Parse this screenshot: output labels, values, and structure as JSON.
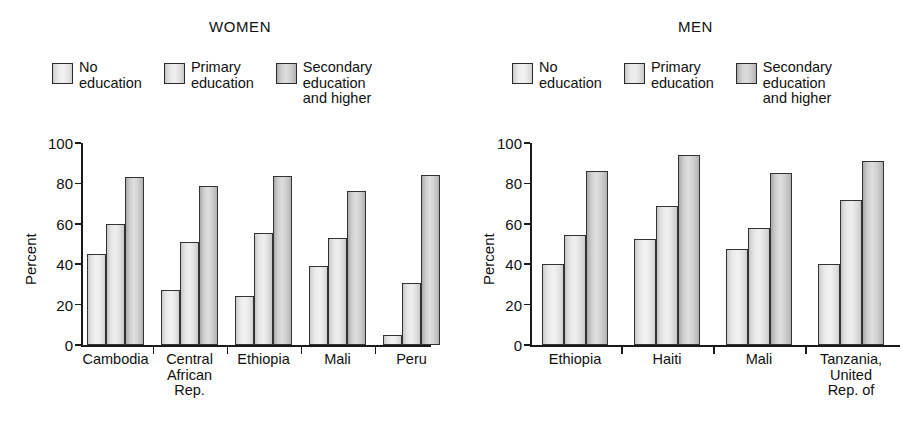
{
  "chart_data": [
    {
      "type": "bar",
      "title": "WOMEN",
      "xlabel": "",
      "ylabel": "Percent",
      "ylim": [
        0,
        100
      ],
      "yticks": [
        0,
        20,
        40,
        60,
        80,
        100
      ],
      "grid": false,
      "legend_position": "top",
      "categories": [
        "Cambodia",
        "Central\nAfrican\nRep.",
        "Ethiopia",
        "Mali",
        "Peru"
      ],
      "series": [
        {
          "name": "No education",
          "values": [
            45,
            27,
            24.5,
            39,
            5
          ]
        },
        {
          "name": "Primary education",
          "values": [
            60,
            51,
            55.5,
            53,
            30.5
          ]
        },
        {
          "name": "Secondary education and higher",
          "values": [
            83,
            78.5,
            83.5,
            76,
            84
          ]
        }
      ]
    },
    {
      "type": "bar",
      "title": "MEN",
      "xlabel": "",
      "ylabel": "Percent",
      "ylim": [
        0,
        100
      ],
      "yticks": [
        0,
        20,
        40,
        60,
        80,
        100
      ],
      "grid": false,
      "legend_position": "top",
      "categories": [
        "Ethiopia",
        "Haiti",
        "Mali",
        "Tanzania,\nUnited Rep. of"
      ],
      "series": [
        {
          "name": "No education",
          "values": [
            40,
            52.5,
            47.5,
            40
          ]
        },
        {
          "name": "Primary education",
          "values": [
            54.5,
            69,
            58,
            72
          ]
        },
        {
          "name": "Secondary education and higher",
          "values": [
            86,
            94,
            85,
            91
          ]
        }
      ]
    }
  ],
  "women": {
    "title": "WOMEN",
    "ylabel": "Percent",
    "yticks": [
      "100",
      "80",
      "60",
      "40",
      "20",
      "0"
    ],
    "legend": [
      {
        "label": "No\neducation",
        "swatch": "fill-a"
      },
      {
        "label": "Primary\neducation",
        "swatch": "fill-b"
      },
      {
        "label": "Secondary\neducation\nand higher",
        "swatch": "fill-c"
      }
    ],
    "categories": [
      "Cambodia",
      "Central\nAfrican\nRep.",
      "Ethiopia",
      "Mali",
      "Peru"
    ]
  },
  "men": {
    "title": "MEN",
    "ylabel": "Percent",
    "yticks": [
      "100",
      "80",
      "60",
      "40",
      "20",
      "0"
    ],
    "legend": [
      {
        "label": "No\neducation",
        "swatch": "fill-a"
      },
      {
        "label": "Primary\neducation",
        "swatch": "fill-b"
      },
      {
        "label": "Secondary\neducation\nand higher",
        "swatch": "fill-c"
      }
    ],
    "categories": [
      "Ethiopia",
      "Haiti",
      "Mali",
      "Tanzania,\nUnited Rep. of"
    ]
  },
  "colors": {
    "axis": "#1a1a1a",
    "bar_outline": "#333333",
    "text": "#111111",
    "background": "#ffffff"
  }
}
